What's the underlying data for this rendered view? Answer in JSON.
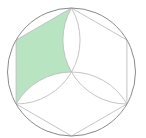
{
  "diagram": {
    "type": "geometry",
    "circle": {
      "cx": 71.5,
      "cy": 72,
      "r": 64
    },
    "vertices": {
      "top": [
        71.5,
        8
      ],
      "upper_right": [
        126.9,
        40
      ],
      "lower_right": [
        126.9,
        104
      ],
      "bottom": [
        71.5,
        136
      ],
      "lower_left": [
        16.1,
        104
      ],
      "upper_left": [
        16.1,
        40
      ],
      "center": [
        71.5,
        72
      ]
    },
    "colors": {
      "shade": "#b9e4c1",
      "circle_stroke": "#8a8a8a",
      "line_stroke": "#bdbdbd",
      "background": "#ffffff"
    }
  }
}
